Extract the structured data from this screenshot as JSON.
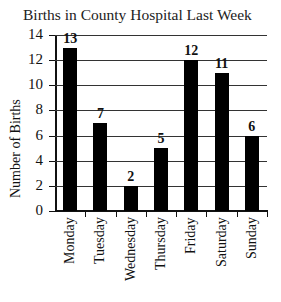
{
  "chart_data": {
    "type": "bar",
    "title": "Births in County Hospital Last Week",
    "xlabel": "",
    "ylabel": "Number of Births",
    "categories": [
      "Monday",
      "Tuesday",
      "Wednesday",
      "Thursday",
      "Friday",
      "Saturday",
      "Sunday"
    ],
    "values": [
      13,
      7,
      2,
      5,
      12,
      11,
      6
    ],
    "data_labels": [
      "13",
      "7",
      "2",
      "5",
      "12",
      "11",
      "6"
    ],
    "ylim": [
      0,
      14
    ],
    "yticks": [
      "0",
      "2",
      "4",
      "6",
      "8",
      "10",
      "12",
      "14"
    ],
    "grid": true,
    "legend": null,
    "bar_color": "#000000"
  }
}
